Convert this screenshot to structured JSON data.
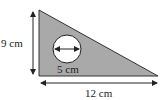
{
  "diagram": {
    "shape": "right-triangle-with-circular-hole",
    "fill_color": "#a9a9a9",
    "stroke_color": "#222222",
    "labels": {
      "height": "9 cm",
      "base": "12 cm",
      "circle_diameter": "5 cm"
    }
  }
}
